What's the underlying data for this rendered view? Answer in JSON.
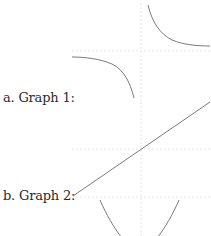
{
  "questions": [
    {
      "label": "a. Graph 1:"
    },
    {
      "label": "b. Graph 2:"
    }
  ],
  "colors": {
    "curve": "#7a7a7a",
    "axis": "#e6e6e6",
    "text": "#2b2b2b"
  },
  "graphs": [
    {
      "name": "graph-1",
      "shape": "hyperbola",
      "description": "two branches in quadrants I and III"
    },
    {
      "name": "graph-2",
      "shape": "line",
      "description": "increasing line through origin"
    },
    {
      "name": "graph-3",
      "shape": "parabola",
      "description": "upward-opening parabola (partially visible)"
    }
  ]
}
